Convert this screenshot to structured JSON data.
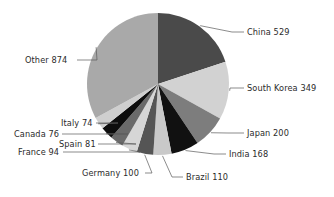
{
  "chart_data": {
    "type": "pie",
    "title": "",
    "xlabel": "",
    "ylabel": "",
    "total": 2665,
    "legend_position": "callout-labels",
    "grid": false,
    "start_angle_deg": 0,
    "direction": "clockwise",
    "categories": [
      "China",
      "South Korea",
      "Japan",
      "India",
      "Brazil",
      "Germany",
      "France",
      "Spain",
      "Canada",
      "Italy",
      "Other"
    ],
    "values": [
      529,
      349,
      200,
      168,
      110,
      100,
      94,
      81,
      76,
      74,
      874
    ],
    "colors": [
      "#4a4a4a",
      "#d2d2d2",
      "#7d7d7d",
      "#111111",
      "#c9c9c9",
      "#555555",
      "#d6d6d6",
      "#6a6a6a",
      "#0d0d0d",
      "#cfcfcf",
      "#a9a9a9"
    ],
    "labels": [
      "China 529",
      "South Korea 349",
      "Japan 200",
      "India 168",
      "Brazil 110",
      "Germany 100",
      "France 94",
      "Spain 81",
      "Canada 76",
      "Italy 74",
      "Other 874"
    ],
    "slices": [
      {
        "name": "China",
        "value": 529,
        "label": "China 529",
        "color": "#4a4a4a"
      },
      {
        "name": "South Korea",
        "value": 349,
        "label": "South Korea 349",
        "color": "#d2d2d2"
      },
      {
        "name": "Japan",
        "value": 200,
        "label": "Japan 200",
        "color": "#7d7d7d"
      },
      {
        "name": "India",
        "value": 168,
        "label": "India 168",
        "color": "#111111"
      },
      {
        "name": "Brazil",
        "value": 110,
        "label": "Brazil 110",
        "color": "#c9c9c9"
      },
      {
        "name": "Germany",
        "value": 100,
        "label": "Germany 100",
        "color": "#555555"
      },
      {
        "name": "France",
        "value": 94,
        "label": "France 94",
        "color": "#d6d6d6"
      },
      {
        "name": "Spain",
        "value": 81,
        "label": "Spain 81",
        "color": "#6a6a6a"
      },
      {
        "name": "Canada",
        "value": 76,
        "label": "Canada 76",
        "color": "#0d0d0d"
      },
      {
        "name": "Italy",
        "value": 74,
        "label": "Italy 74",
        "color": "#cfcfcf"
      },
      {
        "name": "Other",
        "value": 874,
        "label": "Other 874",
        "color": "#a9a9a9"
      }
    ]
  },
  "figure": {
    "background": "#ffffff",
    "center_x": 158,
    "center_y": 84,
    "radius": 71
  },
  "callouts": {
    "china": {
      "text": "China 529",
      "x": 247,
      "y": 35,
      "anchor": "start"
    },
    "south_korea": {
      "text": "South Korea 349",
      "x": 247,
      "y": 91,
      "anchor": "start"
    },
    "japan": {
      "text": "Japan 200",
      "x": 247,
      "y": 136,
      "anchor": "start"
    },
    "india": {
      "text": "India 168",
      "x": 229,
      "y": 157,
      "anchor": "start"
    },
    "brazil": {
      "text": "Brazil 110",
      "x": 186,
      "y": 180,
      "anchor": "start"
    },
    "germany": {
      "text": "Germany 100",
      "x": 82,
      "y": 176,
      "anchor": "start"
    },
    "france": {
      "text": "France 94",
      "x": 18,
      "y": 155,
      "anchor": "start"
    },
    "spain": {
      "text": "Spain 81",
      "x": 59,
      "y": 147,
      "anchor": "start"
    },
    "canada": {
      "text": "Canada 76",
      "x": 14,
      "y": 137,
      "anchor": "start"
    },
    "italy": {
      "text": "Italy 74",
      "x": 61,
      "y": 126,
      "anchor": "start"
    },
    "other": {
      "text": "Other 874",
      "x": 25,
      "y": 63,
      "anchor": "start"
    }
  }
}
